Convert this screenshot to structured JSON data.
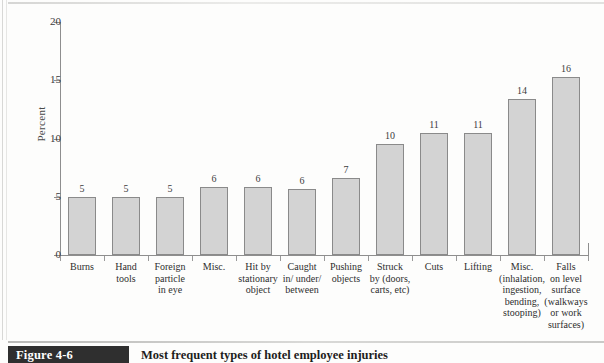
{
  "figure": {
    "number_label": "Figure 4-6",
    "caption": "Most frequent types of hotel employee injuries"
  },
  "chart_data": {
    "type": "bar",
    "title": "Most frequent types of hotel employee injuries",
    "xlabel": "",
    "ylabel": "Percent",
    "ylim": [
      0,
      20
    ],
    "yticks": [
      0,
      5,
      10,
      15,
      20
    ],
    "grid": false,
    "legend": null,
    "categories": [
      "Burns",
      "Hand tools",
      "Foreign particle in eye",
      "Misc.",
      "Hit by stationary object",
      "Caught in/ under/ between",
      "Pushing objects",
      "Struck by (doors, carts, etc)",
      "Cuts",
      "Lifting",
      "Misc. (inhalation, ingestion, bending, stooping)",
      "Falls on level surface (walkways or work surfaces)"
    ],
    "category_lines": [
      [
        "Burns"
      ],
      [
        "Hand",
        "tools"
      ],
      [
        "Foreign",
        "particle",
        "in eye"
      ],
      [
        "Misc."
      ],
      [
        "Hit by",
        "stationary",
        "object"
      ],
      [
        "Caught",
        "in/ under/",
        "between"
      ],
      [
        "Pushing",
        "objects"
      ],
      [
        "Struck",
        "by (doors,",
        "carts, etc)"
      ],
      [
        "Cuts"
      ],
      [
        "Lifting"
      ],
      [
        "Misc.",
        "(inhalation,",
        "ingestion,",
        "bending,",
        "stooping)"
      ],
      [
        "Falls",
        "on level",
        "surface",
        "(walkways",
        "or work",
        "surfaces)"
      ]
    ],
    "values": [
      5,
      5,
      5,
      6,
      6,
      6,
      7,
      10,
      11,
      11,
      14,
      16
    ],
    "bar_heights_plotted": [
      5.0,
      5.0,
      4.95,
      5.85,
      5.85,
      5.7,
      6.65,
      9.5,
      10.5,
      10.5,
      13.4,
      15.3
    ],
    "value_labels": [
      "5",
      "5",
      "5",
      "6",
      "6",
      "6",
      "7",
      "10",
      "11",
      "11",
      "14",
      "16"
    ]
  },
  "colors": {
    "bar_fill": "#d3d3d3",
    "bar_border": "#8a8a8a",
    "axis": "#8e8e8e",
    "text": "#2e2e2e",
    "caption_box": "#2f2f2f",
    "page": "#fdfdfc"
  }
}
